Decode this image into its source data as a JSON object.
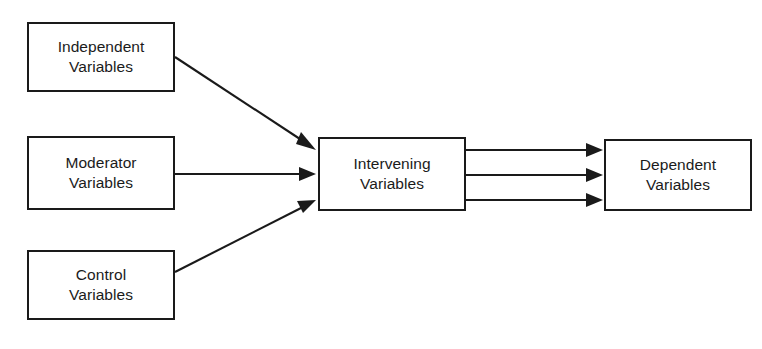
{
  "diagram": {
    "background_color": "#ffffff",
    "line_color": "#1a1a1a",
    "text_color": "#1b1b1b",
    "nodes": [
      {
        "id": "independent",
        "line1": "Independent",
        "line2": "Variables",
        "x": 27,
        "y": 22,
        "w": 148,
        "h": 70
      },
      {
        "id": "moderator",
        "line1": "Moderator",
        "line2": "Variables",
        "x": 27,
        "y": 136,
        "w": 148,
        "h": 74
      },
      {
        "id": "control",
        "line1": "Control",
        "line2": "Variables",
        "x": 27,
        "y": 250,
        "w": 148,
        "h": 70
      },
      {
        "id": "intervening",
        "line1": "Intervening",
        "line2": "Variables",
        "x": 318,
        "y": 137,
        "w": 148,
        "h": 74
      },
      {
        "id": "dependent",
        "line1": "Dependent",
        "line2": "Variables",
        "x": 604,
        "y": 139,
        "w": 148,
        "h": 72
      }
    ],
    "edges": [
      {
        "id": "independent-to-intervening",
        "from": "independent",
        "to": "intervening",
        "style": "diagonal-down"
      },
      {
        "id": "moderator-to-intervening",
        "from": "moderator",
        "to": "intervening",
        "style": "horizontal"
      },
      {
        "id": "control-to-intervening",
        "from": "control",
        "to": "intervening",
        "style": "diagonal-up"
      },
      {
        "id": "intervening-to-dependent-top",
        "from": "intervening",
        "to": "dependent",
        "style": "horizontal"
      },
      {
        "id": "intervening-to-dependent-middle",
        "from": "intervening",
        "to": "dependent",
        "style": "horizontal"
      },
      {
        "id": "intervening-to-dependent-bottom",
        "from": "intervening",
        "to": "dependent",
        "style": "horizontal"
      }
    ]
  }
}
